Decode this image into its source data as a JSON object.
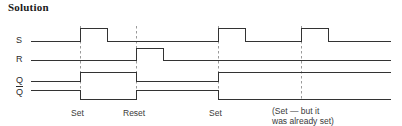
{
  "title": "Solution",
  "signals": {
    "s": "S",
    "r": "R",
    "q": "Q",
    "qbar": "Q"
  },
  "events": [
    {
      "label": "Set",
      "x": 71,
      "y": 108
    },
    {
      "label": "Reset",
      "x": 123,
      "y": 108
    },
    {
      "label": "Set",
      "x": 209,
      "y": 108
    },
    {
      "label": "(Set — but it",
      "x": 272,
      "y": 106
    },
    {
      "label": "was already set)",
      "x": 272,
      "y": 116
    }
  ],
  "colors": {
    "trace": "#333333",
    "dashed": "#9a9a9a",
    "text": "#2b2b2b",
    "background": "#ffffff"
  },
  "chart_data": {
    "type": "line",
    "title": "Solution",
    "xlabel": "",
    "ylabel": "",
    "x_axis_range": [
      30,
      390
    ],
    "markers": [
      {
        "name": "Set",
        "x": 80
      },
      {
        "name": "Reset",
        "x": 136
      },
      {
        "name": "Set",
        "x": 218
      },
      {
        "name": "Set-already-set",
        "x": 301
      }
    ],
    "series": [
      {
        "name": "S",
        "low_y": 41,
        "high_y": 28,
        "transitions": [
          {
            "x": 30,
            "level": 0
          },
          {
            "x": 80,
            "level": 1
          },
          {
            "x": 107,
            "level": 0
          },
          {
            "x": 218,
            "level": 1
          },
          {
            "x": 245,
            "level": 0
          },
          {
            "x": 301,
            "level": 1
          },
          {
            "x": 328,
            "level": 0
          },
          {
            "x": 390,
            "level": 0
          }
        ]
      },
      {
        "name": "R",
        "low_y": 60,
        "high_y": 48,
        "transitions": [
          {
            "x": 30,
            "level": 0
          },
          {
            "x": 136,
            "level": 1
          },
          {
            "x": 163,
            "level": 0
          },
          {
            "x": 390,
            "level": 0
          }
        ]
      },
      {
        "name": "Q",
        "low_y": 81,
        "high_y": 72,
        "transitions": [
          {
            "x": 30,
            "level": 0
          },
          {
            "x": 80,
            "level": 1
          },
          {
            "x": 136,
            "level": 0
          },
          {
            "x": 218,
            "level": 1
          },
          {
            "x": 390,
            "level": 1
          }
        ]
      },
      {
        "name": "Qbar",
        "low_y": 99,
        "high_y": 90,
        "transitions": [
          {
            "x": 30,
            "level": 1
          },
          {
            "x": 80,
            "level": 0
          },
          {
            "x": 136,
            "level": 1
          },
          {
            "x": 218,
            "level": 0
          },
          {
            "x": 390,
            "level": 0
          }
        ]
      }
    ]
  }
}
